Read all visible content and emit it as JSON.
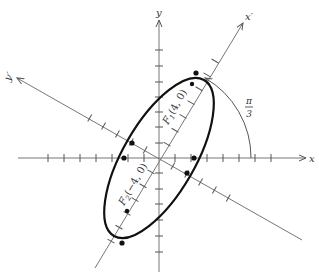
{
  "figure": {
    "title": "",
    "axes": {
      "x_label": "x",
      "y_label": "y",
      "x_rot_label": "x′",
      "y_rot_label": "y′"
    },
    "rotation_angle_label": {
      "num": "π",
      "den": "3"
    },
    "foci": [
      {
        "name": "F1",
        "label_main": "F",
        "label_sub": "1",
        "label_coords": "(4, 0)"
      },
      {
        "name": "F2",
        "label_main": "F",
        "label_sub": "2",
        "label_coords": "(−4, 0)"
      }
    ],
    "colors": {
      "curve": "#111111",
      "axes": "#777777",
      "background": "#ffffff"
    }
  }
}
